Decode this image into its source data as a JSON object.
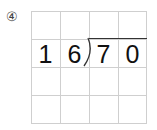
{
  "problem": {
    "number_label": "④",
    "divisor": [
      "1",
      "6"
    ],
    "dividend": [
      "7",
      "0"
    ]
  },
  "grid": {
    "rows": 4,
    "cols": 4
  }
}
